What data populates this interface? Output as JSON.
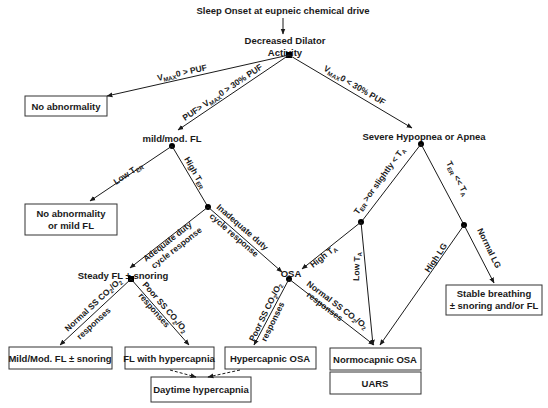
{
  "diagram": {
    "root": "Sleep Onset at eupneic chemical drive",
    "dilator": [
      "Decreased Dilator",
      "Activity"
    ],
    "nodes": {
      "no_abnormality": "No abnormality",
      "mild_mod_fl": "mild/mod. FL",
      "severe": "Severe Hypopnea or Apnea",
      "no_abn_mild": [
        "No abnormality",
        "or mild FL"
      ],
      "steady_fl": "Steady FL ± snoring",
      "osa": "OSA",
      "stable": [
        "Stable breathing",
        "± snoring and/or FL"
      ],
      "mild_mod_snoring": "Mild/Mod. FL ± snoring",
      "fl_hypercapnia": "FL with hypercapnia",
      "hypercapnic_osa": "Hypercapnic OSA",
      "normocapnic_osa": "Normocapnic OSA",
      "uars": "UARS",
      "daytime": "Daytime hypercapnia"
    },
    "edges": {
      "vmax_gt_puf": {
        "v": "V",
        "sub": "MAX",
        "rest": "0 > PUF"
      },
      "puf_range": {
        "pre": "PUF> ",
        "v": "V",
        "sub": "MAX",
        "rest": "0 > 30% PUF"
      },
      "vmax_lt_30": {
        "v": "V",
        "sub": "MAX",
        "rest": "0 < 30% PUF"
      },
      "low_ter": {
        "pre": "Low T",
        "sub": "ER"
      },
      "high_ter": {
        "pre": "High T",
        "sub": "ER"
      },
      "adequate": [
        "Adequate duty",
        "cycle response"
      ],
      "inadequate": [
        "Inadequate duty",
        "cycle response"
      ],
      "ter_slightly": {
        "t": "T",
        "sub": "ER",
        "mid": " >or slightly < T",
        "sub2": "A"
      },
      "ter_ll_ta": {
        "t": "T",
        "sub": "ER",
        "mid": " << T",
        "sub2": "A"
      },
      "high_ta": {
        "pre": "High T",
        "sub": "A"
      },
      "low_ta": {
        "pre": "Low T",
        "sub": "A"
      },
      "high_lg": "High LG",
      "normal_lg": "Normal LG",
      "normal_ss_1": {
        "l1a": "Normal SS CO",
        "s1": "2",
        "l1b": "/O",
        "s2": "2",
        "l2": "responses"
      },
      "poor_ss_1": {
        "l1a": "Poor SS CO",
        "s1": "2",
        "l1b": "/O",
        "s2": "2",
        "l2": "responses"
      },
      "poor_ss_2": {
        "l1a": "Poor SS CO",
        "s1": "2",
        "l1b": "/O",
        "s2": "2",
        "l2": "responses"
      },
      "normal_ss_2": {
        "l1a": "Normal SS CO",
        "s1": "2",
        "l1b": "/O",
        "s2": "2",
        "l2": "responses"
      }
    },
    "colors": {
      "line": "#1a1a1a",
      "box_border": "#333333",
      "background": "#ffffff"
    }
  }
}
